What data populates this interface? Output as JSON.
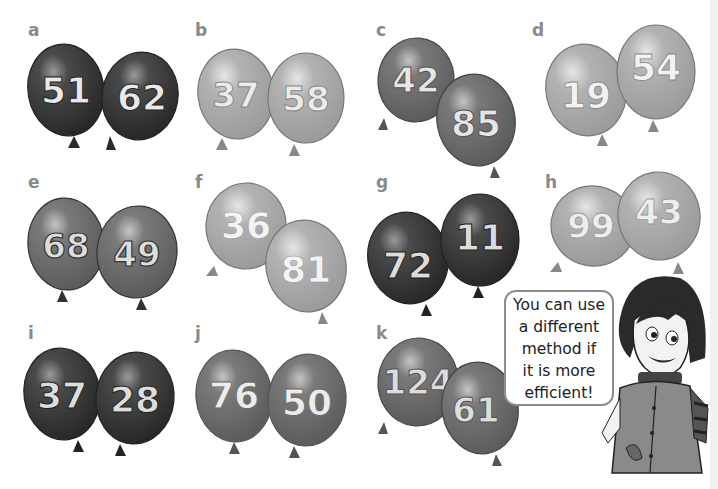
{
  "colors": {
    "dark": "#3a3a3a",
    "mid": "#6f6f6f",
    "light": "#a9a9a9",
    "number_fill": "#e9e9e9",
    "label": "#8a8a8a"
  },
  "problems": [
    {
      "label": "a",
      "numbers": [
        "51",
        "62"
      ],
      "shade": "dark"
    },
    {
      "label": "b",
      "numbers": [
        "37",
        "58"
      ],
      "shade": "light"
    },
    {
      "label": "c",
      "numbers": [
        "42",
        "85"
      ],
      "shade": "mid"
    },
    {
      "label": "d",
      "numbers": [
        "19",
        "54"
      ],
      "shade": "light"
    },
    {
      "label": "e",
      "numbers": [
        "68",
        "49"
      ],
      "shade": "mid"
    },
    {
      "label": "f",
      "numbers": [
        "36",
        "81"
      ],
      "shade": "light"
    },
    {
      "label": "g",
      "numbers": [
        "72",
        "11"
      ],
      "shade": "dark"
    },
    {
      "label": "h",
      "numbers": [
        "99",
        "43"
      ],
      "shade": "light"
    },
    {
      "label": "i",
      "numbers": [
        "37",
        "28"
      ],
      "shade": "dark"
    },
    {
      "label": "j",
      "numbers": [
        "76",
        "50"
      ],
      "shade": "mid"
    },
    {
      "label": "k",
      "numbers": [
        "124",
        "61"
      ],
      "shade": "mid"
    }
  ],
  "speech_bubble": {
    "lines": [
      "You can use",
      "a different",
      "method if",
      "it is more",
      "efficient!"
    ]
  }
}
